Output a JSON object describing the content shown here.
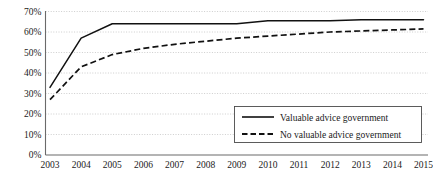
{
  "chart_data": {
    "type": "line",
    "title": "",
    "xlabel": "",
    "ylabel": "",
    "grid": true,
    "legend_position": "inside-bottom-right",
    "x": [
      "2003",
      "2004",
      "2005",
      "2006",
      "2007",
      "2008",
      "2009",
      "2010",
      "2011",
      "2012",
      "2013",
      "2014",
      "2015"
    ],
    "xtick_labels": [
      "2003",
      "2004",
      "2005",
      "2006",
      "2007",
      "2008",
      "2009",
      "2010",
      "2011",
      "2012",
      "2013",
      "2014",
      "2015"
    ],
    "ytick_labels": [
      "0%",
      "10%",
      "20%",
      "30%",
      "40%",
      "50%",
      "60%",
      "70%"
    ],
    "ytick_values": [
      0,
      10,
      20,
      30,
      40,
      50,
      60,
      70
    ],
    "ylim": [
      0,
      70
    ],
    "series": [
      {
        "name": "Valuable advice government",
        "style": "solid",
        "color": "#111111",
        "values": [
          33,
          57,
          64,
          64,
          64,
          64,
          64,
          65.5,
          65.5,
          65.5,
          66,
          66,
          66
        ]
      },
      {
        "name": "No valuable advice government",
        "style": "dashed",
        "color": "#111111",
        "values": [
          27,
          43,
          49,
          52,
          54,
          55.5,
          57,
          58,
          59,
          60,
          60.5,
          61,
          61.5
        ]
      }
    ]
  },
  "legend": {
    "entries": [
      {
        "label": "Valuable advice government",
        "style": "solid"
      },
      {
        "label": "No valuable advice government",
        "style": "dashed"
      }
    ]
  }
}
